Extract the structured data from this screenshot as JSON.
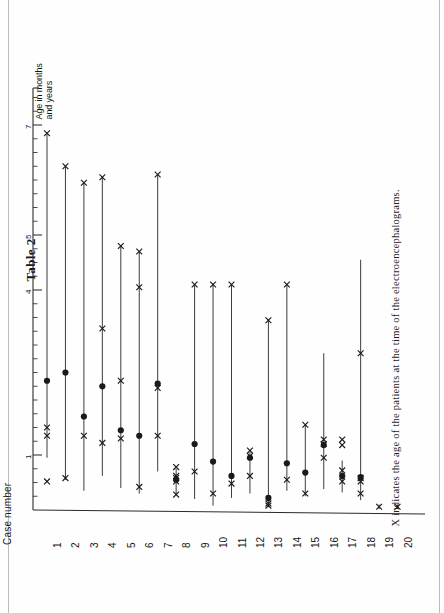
{
  "document": {
    "table_title": "Table 2",
    "caption": "X indicates the age of the patients at the time of the electroencephalograms."
  },
  "axes": {
    "value_axis_label": "Age in months\nand years",
    "case_axis_label": "Case number",
    "value_tick_labels": [
      "7",
      "5",
      "4",
      "1"
    ],
    "case_tick_labels": [
      "1",
      "2",
      "3",
      "4",
      "5",
      "6",
      "7",
      "8",
      "9",
      "10",
      "11",
      "12",
      "13",
      "14",
      "15",
      "16",
      "17",
      "18",
      "19",
      "20"
    ]
  },
  "legend": {
    "x_marker_meaning": "age of the patients at the time of the electroencephalograms",
    "x_marker_symbol": "X",
    "dot_marker_symbol": "●"
  },
  "colors": {
    "ink": "#1a1a1a",
    "rule": "#2b2b2b",
    "paper": "#ffffff",
    "scan_edge": "#bdbdbd"
  },
  "chart_data": {
    "type": "scatter",
    "title": "Table 2",
    "xlabel": "Case number",
    "ylabel": "Age in months and years",
    "orientation": "vertical-range-per-case",
    "ylim": [
      0,
      7.6
    ],
    "grid": false,
    "legend": "none",
    "y_major_ticks": [
      1,
      4,
      5,
      7
    ],
    "y_minor_tick_step": 0.25,
    "categories": [
      "1",
      "2",
      "3",
      "4",
      "5",
      "6",
      "7",
      "8",
      "9",
      "10",
      "11",
      "12",
      "13",
      "14",
      "15",
      "16",
      "17",
      "18",
      "19",
      "20"
    ],
    "series": [
      {
        "name": "range_low",
        "values": [
          0.95,
          0.55,
          0.35,
          0.62,
          0.4,
          0.3,
          0.7,
          0.28,
          0.2,
          0.08,
          0.22,
          0.3,
          0.05,
          0.35,
          0.25,
          0.38,
          0.32,
          0.18,
          0.02,
          0.02
        ]
      },
      {
        "name": "range_high",
        "values": [
          6.85,
          6.25,
          5.95,
          6.05,
          4.8,
          4.7,
          6.1,
          0.75,
          4.1,
          4.1,
          4.1,
          1.05,
          3.45,
          4.1,
          1.55,
          2.85,
          0.9,
          4.55,
          0.1,
          0.1
        ]
      },
      {
        "name": "dot_age",
        "values": [
          2.35,
          2.5,
          1.7,
          2.25,
          1.45,
          1.35,
          2.3,
          0.55,
          1.2,
          0.88,
          0.62,
          0.95,
          0.22,
          0.85,
          0.68,
          1.18,
          0.62,
          0.6,
          null,
          null
        ]
      }
    ],
    "eeg_ages": [
      {
        "case": "1",
        "values": [
          6.85,
          1.5,
          1.35,
          0.52
        ]
      },
      {
        "case": "2",
        "values": [
          6.25,
          0.58
        ]
      },
      {
        "case": "3",
        "values": [
          5.95,
          1.35
        ]
      },
      {
        "case": "4",
        "values": [
          6.05,
          3.3,
          1.22
        ]
      },
      {
        "case": "5",
        "values": [
          4.8,
          2.35,
          1.3
        ]
      },
      {
        "case": "6",
        "values": [
          4.7,
          4.05,
          0.42
        ]
      },
      {
        "case": "7",
        "values": [
          6.1,
          2.22,
          1.35
        ]
      },
      {
        "case": "8",
        "values": [
          0.78,
          0.62,
          0.58,
          0.52,
          0.28
        ]
      },
      {
        "case": "9",
        "values": [
          4.1,
          0.7
        ]
      },
      {
        "case": "10",
        "values": [
          4.1,
          0.3
        ]
      },
      {
        "case": "11",
        "values": [
          4.1,
          0.48
        ]
      },
      {
        "case": "12",
        "values": [
          1.08,
          0.98,
          0.62
        ]
      },
      {
        "case": "13",
        "values": [
          3.45,
          0.12,
          0.08
        ]
      },
      {
        "case": "14",
        "values": [
          4.1,
          0.55
        ]
      },
      {
        "case": "15",
        "values": [
          1.55,
          0.3
        ]
      },
      {
        "case": "16",
        "values": [
          1.28,
          1.2,
          0.95
        ]
      },
      {
        "case": "17",
        "values": [
          1.28,
          1.18,
          0.72,
          0.52
        ]
      },
      {
        "case": "18",
        "values": [
          2.85,
          0.58,
          0.52,
          0.3
        ]
      },
      {
        "case": "19",
        "values": [
          0.06
        ]
      },
      {
        "case": "20",
        "values": [
          0.06
        ]
      }
    ]
  }
}
